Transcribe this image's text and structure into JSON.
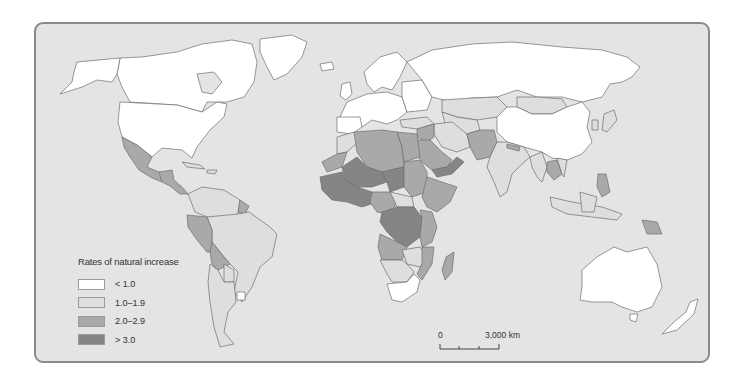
{
  "legend": {
    "title": "Rates of natural increase",
    "items": [
      {
        "label": "< 1.0",
        "color": "#ffffff"
      },
      {
        "label": "1.0–1.9",
        "color": "#dedede"
      },
      {
        "label": "2.0–2.9",
        "color": "#a9a9a9"
      },
      {
        "label": "> 3.0",
        "color": "#858585"
      }
    ]
  },
  "scale_bar": {
    "start_label": "0",
    "end_label": "3,000 km"
  },
  "colors": {
    "ocean": "#e4e4e4",
    "frame_border": "#8a8a8a",
    "country_border": "#6e6e6e"
  }
}
